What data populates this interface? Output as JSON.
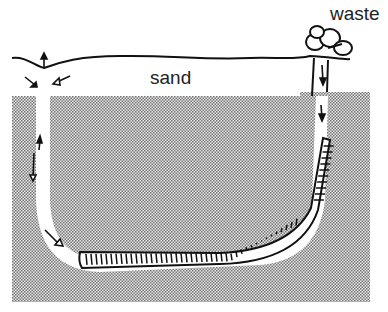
{
  "diagram": {
    "labels": {
      "sand": "sand",
      "waste": "waste"
    },
    "colors": {
      "stipple": "#8a8a8a",
      "background": "#ffffff",
      "ink": "#111111"
    }
  }
}
